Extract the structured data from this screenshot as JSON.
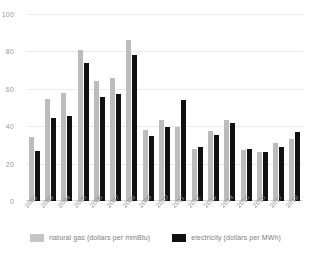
{
  "chart_data": {
    "type": "bar",
    "title": "",
    "subtitle": "",
    "xlabel": "",
    "ylabel": "",
    "ylim": [
      0,
      100
    ],
    "yticks": [
      0,
      20,
      40,
      60,
      80,
      100
    ],
    "grid": true,
    "legend_position": "bottom",
    "categories": [
      "2002",
      "2003",
      "2004",
      "2005",
      "2006",
      "2007",
      "2008",
      "2009",
      "2010",
      "2011",
      "2012",
      "2013",
      "2014",
      "2015",
      "2016",
      "2017",
      "2018"
    ],
    "series": [
      {
        "name": "natural gas (dollars per mmBtu)",
        "color": "#bcbcbc",
        "values": [
          34,
          54.5,
          57.5,
          80.5,
          64,
          66,
          86,
          38,
          43.5,
          39.5,
          28,
          37.5,
          43.5,
          27.5,
          26,
          31,
          33
        ]
      },
      {
        "name": "electricity (dollars per MWh)",
        "color": "#111111",
        "values": [
          27,
          44.5,
          45.5,
          74,
          55.5,
          57,
          78,
          35,
          39.5,
          54,
          29,
          35.5,
          41.5,
          28,
          26,
          29,
          37
        ]
      }
    ]
  },
  "axis": {
    "y_tick_labels": [
      "100",
      "80",
      "60",
      "40",
      "20",
      "0"
    ]
  },
  "legend": {
    "entries": [
      {
        "label": "natural gas (dollars per mmBtu)",
        "swatch": "gray-swatch-icon"
      },
      {
        "label": "electricity (dollars per MWh)",
        "swatch": "black-swatch-icon"
      }
    ]
  }
}
